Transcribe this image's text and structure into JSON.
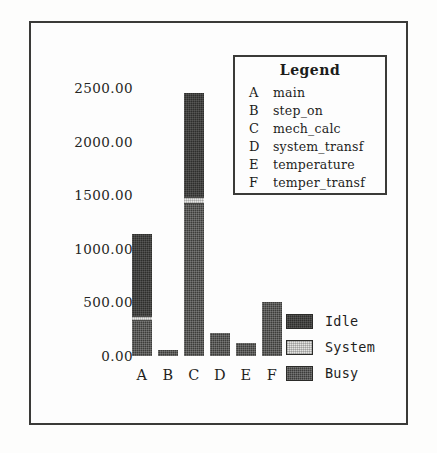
{
  "chart_data": {
    "type": "bar",
    "title": "",
    "subtitle": "",
    "xlabel": "",
    "ylabel": "",
    "stacked": true,
    "grid": false,
    "ylim": [
      0,
      2700
    ],
    "ytick_labels": [
      "0.00",
      "500.00",
      "1000.00",
      "1500.00",
      "2000.00",
      "2500.00"
    ],
    "ytick_values": [
      0,
      500,
      1000,
      1500,
      2000,
      2500
    ],
    "categories": [
      "A",
      "B",
      "C",
      "D",
      "E",
      "F"
    ],
    "legend_position": "inset-top-right",
    "series": [
      {
        "name": "Busy",
        "values": [
          330,
          60,
          1420,
          215,
          120,
          500
        ]
      },
      {
        "name": "System",
        "values": [
          40,
          0,
          60,
          0,
          0,
          0
        ]
      },
      {
        "name": "Idle",
        "values": [
          765,
          0,
          970,
          0,
          0,
          0
        ]
      }
    ],
    "totals": [
      1135,
      60,
      2450,
      215,
      120,
      500
    ],
    "annotations": []
  },
  "legend": {
    "title": "Legend",
    "entries": [
      {
        "key": "A",
        "name": "main"
      },
      {
        "key": "B",
        "name": "step_on"
      },
      {
        "key": "C",
        "name": "mech_calc"
      },
      {
        "key": "D",
        "name": "system_transf"
      },
      {
        "key": "E",
        "name": "temperature"
      },
      {
        "key": "F",
        "name": "temper_transf"
      }
    ]
  },
  "series_key": {
    "items": [
      {
        "label": "Idle",
        "color": "#2e2e2c"
      },
      {
        "label": "System",
        "color": "#e4e4e2"
      },
      {
        "label": "Busy",
        "color": "#3c3c3a"
      }
    ]
  },
  "colors": {
    "page_background": "#fdfdfc",
    "frame_border": "#3a3a38",
    "text": "#1f1f1d",
    "idle": "#2e2e2c",
    "system": "#e4e4e2",
    "busy": "#3c3c3a"
  }
}
